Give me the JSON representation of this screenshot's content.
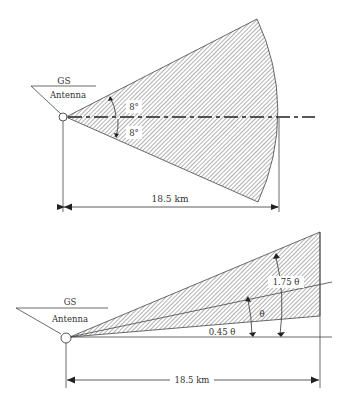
{
  "figure_top": {
    "station_label": "GS",
    "antenna_label": "Antenna",
    "upper_angle_label": "8°",
    "lower_angle_label": "8°",
    "distance_label": "18.5 km",
    "colors": {
      "stroke": "#333333",
      "hatch": "#555555"
    }
  },
  "figure_bottom": {
    "station_label": "GS",
    "antenna_label": "Antenna",
    "upper_angle_label": "1.75 θ",
    "middle_angle_label": "θ",
    "lower_angle_label": "0.45 θ",
    "distance_label": "18.5 km",
    "colors": {
      "stroke": "#333333",
      "hatch": "#555555"
    }
  }
}
